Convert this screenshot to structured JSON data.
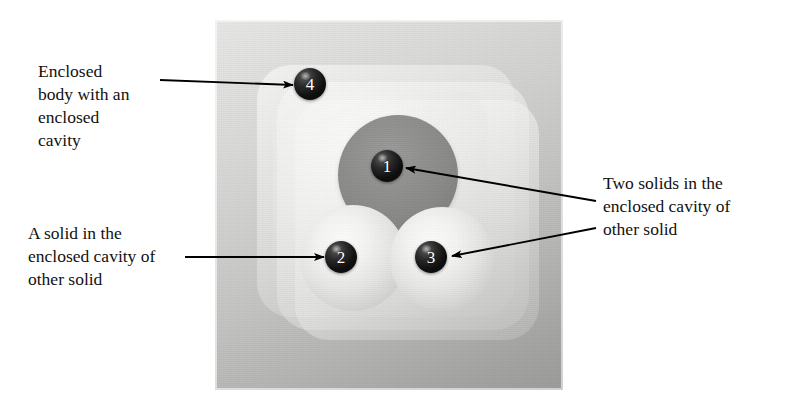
{
  "figure": {
    "background_color": "#ffffff"
  },
  "captions": {
    "enclosed_body": "Enclosed\nbody with an\nenclosed\ncavity",
    "solid_in_cavity": "A solid in the\nenclosed cavity of\nother solid",
    "two_solids": "Two solids in the\nenclosed cavity of\nother solid"
  },
  "callouts": [
    {
      "id": 1,
      "label": "1"
    },
    {
      "id": 2,
      "label": "2"
    },
    {
      "id": 3,
      "label": "3"
    },
    {
      "id": 4,
      "label": "4"
    }
  ],
  "colors": {
    "callout_fill": "#0a0a0a",
    "callout_text": "#ffffff",
    "panel_light": "#e7e7e5",
    "panel_dark": "#9b9b99",
    "sphere_dark": "#8a8a89",
    "sphere_light": "#f1f1ef",
    "leader_line": "#000000",
    "text": "#111111"
  }
}
